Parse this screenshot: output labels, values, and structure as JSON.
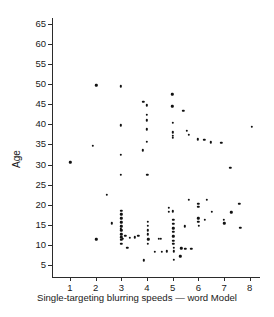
{
  "chart_data": {
    "type": "scatter",
    "title": "",
    "xlabel": "Single-targeting blurring speeds — word Model",
    "ylabel": "Age",
    "xlim": [
      0.3,
      8.4
    ],
    "ylim": [
      2.0,
      66.5
    ],
    "xticks": [
      1,
      2,
      3,
      4,
      5,
      6,
      7,
      8
    ],
    "yticks": [
      5,
      10,
      15,
      20,
      25,
      30,
      35,
      40,
      45,
      50,
      55,
      60,
      65
    ],
    "xtick_labels": [
      "1",
      "2",
      "3",
      "4",
      "5",
      "6",
      "7",
      "8"
    ],
    "ytick_labels": [
      "5",
      "10",
      "15",
      "20",
      "25",
      "30",
      "35",
      "40",
      "45",
      "50",
      "55",
      "60",
      "65"
    ],
    "grid": false,
    "legend": null,
    "marker": "dot",
    "marker_color": "#111111",
    "point_count": 118,
    "points": [
      [
        1.02,
        30.6
      ],
      [
        1.88,
        34.7
      ],
      [
        2.03,
        49.7
      ],
      [
        2.02,
        11.4
      ],
      [
        2.43,
        22.5
      ],
      [
        2.62,
        15.4
      ],
      [
        2.99,
        49.5
      ],
      [
        2.99,
        39.8
      ],
      [
        2.99,
        32.5
      ],
      [
        2.99,
        27.4
      ],
      [
        3.0,
        18.5
      ],
      [
        3.0,
        17.6
      ],
      [
        3.0,
        16.6
      ],
      [
        3.0,
        15.6
      ],
      [
        3.0,
        14.6
      ],
      [
        3.0,
        12.6
      ],
      [
        3.0,
        11.9
      ],
      [
        3.0,
        11.2
      ],
      [
        3.0,
        10.3
      ],
      [
        3.16,
        12.2
      ],
      [
        3.23,
        9.2
      ],
      [
        3.33,
        11.8
      ],
      [
        3.52,
        11.9
      ],
      [
        3.66,
        12.3
      ],
      [
        3.85,
        45.6
      ],
      [
        3.84,
        33.6
      ],
      [
        3.87,
        6.2
      ],
      [
        4.0,
        44.8
      ],
      [
        4.0,
        42.4
      ],
      [
        4.0,
        38.8
      ],
      [
        4.0,
        35.6
      ],
      [
        4.01,
        27.5
      ],
      [
        4.02,
        14.8
      ],
      [
        4.02,
        13.6
      ],
      [
        4.02,
        12.6
      ],
      [
        4.03,
        10.3
      ],
      [
        4.31,
        8.3
      ],
      [
        4.47,
        11.5
      ],
      [
        4.54,
        11.5
      ],
      [
        4.58,
        8.3
      ],
      [
        4.76,
        8.4
      ],
      [
        4.99,
        47.5
      ],
      [
        4.99,
        44.5
      ],
      [
        5.0,
        40.4
      ],
      [
        5.0,
        38.0
      ],
      [
        5.0,
        36.6
      ],
      [
        5.01,
        18.4
      ],
      [
        5.02,
        15.2
      ],
      [
        5.02,
        14.1
      ],
      [
        5.02,
        13.2
      ],
      [
        5.02,
        12.1
      ],
      [
        5.03,
        11.0
      ],
      [
        5.03,
        10.2
      ],
      [
        5.04,
        8.4
      ],
      [
        5.04,
        6.3
      ],
      [
        4.85,
        19.2
      ],
      [
        4.86,
        18.3
      ],
      [
        5.33,
        9.1
      ],
      [
        5.3,
        7.2
      ],
      [
        5.42,
        43.4
      ],
      [
        5.47,
        14.6
      ],
      [
        5.49,
        9.0
      ],
      [
        5.56,
        38.4
      ],
      [
        5.63,
        37.4
      ],
      [
        5.63,
        21.3
      ],
      [
        5.73,
        9.0
      ],
      [
        5.98,
        36.3
      ],
      [
        5.99,
        20.3
      ],
      [
        6.0,
        19.5
      ],
      [
        6.0,
        16.6
      ],
      [
        6.0,
        15.7
      ],
      [
        6.01,
        14.7
      ],
      [
        6.23,
        36.2
      ],
      [
        6.25,
        16.3
      ],
      [
        6.32,
        21.2
      ],
      [
        6.48,
        35.5
      ],
      [
        6.52,
        18.2
      ],
      [
        6.9,
        35.4
      ],
      [
        7.0,
        16.2
      ],
      [
        7.01,
        15.4
      ],
      [
        7.25,
        29.2
      ],
      [
        7.28,
        18.1
      ],
      [
        7.6,
        20.2
      ],
      [
        7.63,
        14.3
      ],
      [
        8.08,
        39.4
      ],
      [
        3.0,
        13.6
      ],
      [
        4.02,
        15.7
      ],
      [
        5.02,
        16.2
      ],
      [
        3.05,
        11.5
      ],
      [
        4.05,
        11.4
      ],
      [
        5.05,
        9.2
      ],
      [
        2.98,
        14.0
      ],
      [
        4.0,
        41.0
      ],
      [
        5.0,
        37.2
      ]
    ]
  }
}
